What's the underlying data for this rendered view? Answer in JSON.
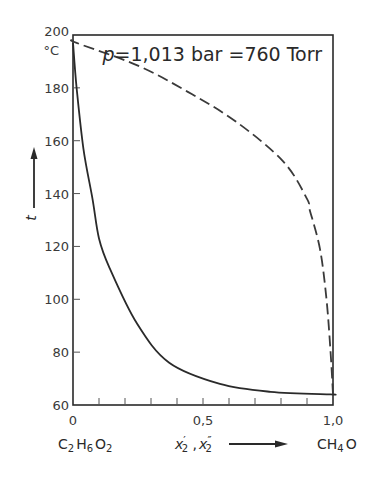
{
  "chart_data": {
    "type": "line",
    "title_parts": {
      "symbol": "p",
      "rest": "=1,013 bar =760 Torr"
    },
    "xlabel": "x'2 , x''2",
    "xlabel_parts": {
      "x1": "x",
      "p1": "′",
      "s1": "2",
      "sep": " ,",
      "x2": "x",
      "p2": "″",
      "s2": "2"
    },
    "ylabel": "t",
    "y_unit": "°C",
    "xlim": [
      0,
      1.0
    ],
    "ylim": [
      60,
      200
    ],
    "x_ticks": [
      "0",
      "0,5",
      "1,0"
    ],
    "x_tick_values": [
      0,
      0.5,
      1.0
    ],
    "x_minor_ticks": [
      0.1,
      0.2,
      0.3,
      0.4,
      0.5,
      0.6,
      0.7,
      0.8,
      0.9
    ],
    "y_ticks": [
      "60",
      "80",
      "100",
      "120",
      "140",
      "160",
      "180",
      "200"
    ],
    "y_tick_values": [
      60,
      80,
      100,
      120,
      140,
      160,
      180,
      200
    ],
    "x_left_component": {
      "C": "C",
      "s1": "2",
      "H": "H",
      "s2": "6",
      "O": "O",
      "s3": "2"
    },
    "x_right_component": {
      "CH": "CH",
      "s1": "4",
      "O": "O"
    },
    "grid": false,
    "legend": null,
    "series": [
      {
        "name": "boiling curve (liquid, x'2)",
        "style": "solid",
        "x": [
          0.0,
          0.014,
          0.04,
          0.075,
          0.1,
          0.14,
          0.245,
          0.37,
          0.565,
          0.76,
          0.99,
          1.0
        ],
        "y": [
          197,
          180,
          157,
          138,
          123,
          112,
          91,
          76,
          68,
          65,
          64,
          64
        ]
      },
      {
        "name": "dew curve (vapor, x''2)",
        "style": "dashed",
        "x": [
          0.0,
          0.014,
          0.245,
          0.44,
          0.63,
          0.81,
          0.9,
          0.91,
          0.95,
          0.975,
          0.99,
          1.0
        ],
        "y": [
          198,
          197,
          188.6,
          178.6,
          167,
          152,
          138,
          134,
          119,
          100,
          81,
          64
        ]
      }
    ]
  }
}
